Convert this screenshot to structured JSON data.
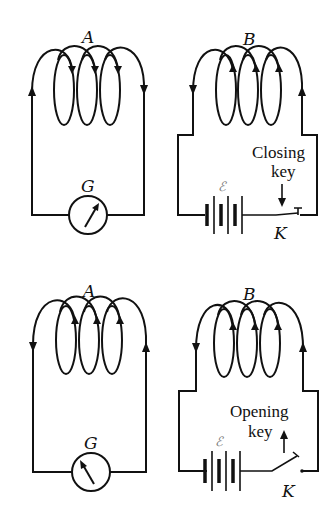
{
  "figure": {
    "panels": [
      {
        "id": "top-left",
        "coil_label": "A",
        "meter_label": "G",
        "current_direction": "clockwise-top",
        "needle": "right"
      },
      {
        "id": "top-right",
        "coil_label": "B",
        "battery_label": "ℰ",
        "key_label": "K",
        "key_text_line1": "Closing",
        "key_text_line2": "key",
        "key_state": "closed",
        "arrow": "down"
      },
      {
        "id": "bottom-left",
        "coil_label": "A",
        "meter_label": "G",
        "current_direction": "counterclockwise-top",
        "needle": "left"
      },
      {
        "id": "bottom-right",
        "coil_label": "B",
        "battery_label": "ℰ",
        "key_label": "K",
        "key_text_line1": "Opening",
        "key_text_line2": "key",
        "key_state": "open",
        "arrow": "up"
      }
    ]
  }
}
